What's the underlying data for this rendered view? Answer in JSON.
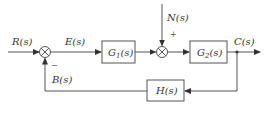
{
  "diagram": {
    "type": "block-diagram",
    "title": "",
    "signals": {
      "input": "R(s)",
      "error": "E(s)",
      "disturbance": "N(s)",
      "output": "C(s)",
      "feedback": "B(s)"
    },
    "blocks": [
      {
        "id": "G1",
        "label_main": "G",
        "label_sub": "1",
        "label_tail": "(s)"
      },
      {
        "id": "G2",
        "label_main": "G",
        "label_sub": "2",
        "label_tail": "(s)"
      },
      {
        "id": "H",
        "label_main": "H(s)"
      }
    ],
    "summing_junctions": [
      {
        "id": "sum1",
        "inputs": [
          "R(s) +",
          "B(s) -"
        ],
        "minus_sign": "−"
      },
      {
        "id": "sum2",
        "inputs": [
          "G1 output",
          "N(s) +"
        ],
        "plus_sign": "+"
      }
    ],
    "connections": [
      "R(s) -> sum1",
      "sum1 -> E(s) -> G1",
      "G1 -> sum2",
      "N(s) -> sum2",
      "sum2 -> G2",
      "G2 -> C(s)",
      "C(s) -> H",
      "H -> B(s) -> sum1"
    ],
    "colors": {
      "line": "#555555",
      "text": "#333333",
      "background": "#ffffff"
    }
  }
}
